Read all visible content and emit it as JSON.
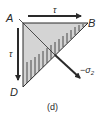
{
  "diagram": {
    "type": "stress-element-wedge",
    "vertices": {
      "A": {
        "label": "A",
        "x": 23,
        "y": 23
      },
      "B": {
        "label": "B",
        "x": 88,
        "y": 23
      },
      "D": {
        "label": "D",
        "x": 23,
        "y": 87
      }
    },
    "arrows": {
      "top_shear": {
        "label": "τ",
        "direction": "right"
      },
      "left_shear": {
        "label": "τ",
        "direction": "down"
      },
      "normal_stress": {
        "label": "−σ",
        "subscript": "2",
        "direction": "down-right"
      }
    },
    "caption": "(d)",
    "colors": {
      "fill": "#d4d4d4",
      "stroke": "#2a2a2a",
      "hatch": "#3a3a3a"
    }
  }
}
